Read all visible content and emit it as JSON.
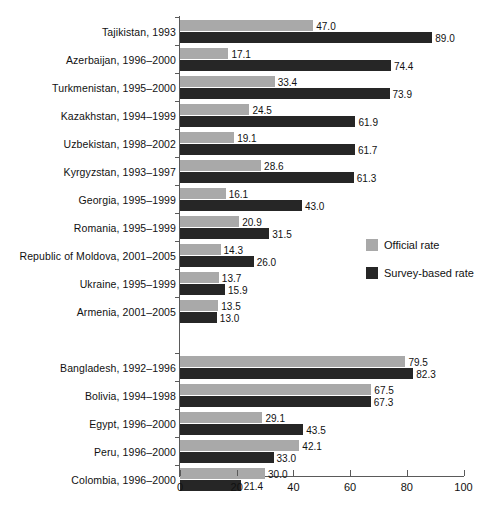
{
  "chart_data": {
    "type": "bar",
    "orientation": "horizontal",
    "title": "",
    "xlabel": "",
    "ylabel": "",
    "xlim": [
      0,
      100
    ],
    "xticks": [
      0,
      20,
      40,
      60,
      80,
      100
    ],
    "grid": false,
    "legend_position": "middle-right",
    "series": [
      {
        "name": "Official rate",
        "color": "#a9a9a9",
        "values": [
          47.0,
          17.1,
          33.4,
          24.5,
          19.1,
          28.6,
          16.1,
          20.9,
          14.3,
          13.7,
          13.5,
          79.5,
          67.5,
          29.1,
          42.1,
          30.0
        ]
      },
      {
        "name": "Survey-based rate",
        "color": "#262626",
        "values": [
          89.0,
          74.4,
          73.9,
          61.9,
          61.7,
          61.3,
          43.0,
          31.5,
          26.0,
          15.9,
          13.0,
          82.3,
          67.3,
          43.5,
          33.0,
          21.4
        ]
      }
    ],
    "categories": [
      "Tajikistan, 1993",
      "Azerbaijan, 1996–2000",
      "Turkmenistan, 1995–2000",
      "Kazakhstan, 1994–1999",
      "Uzbekistan, 1998–2002",
      "Kyrgyzstan, 1993–1997",
      "Georgia, 1995–1999",
      "Romania, 1995–1999",
      "Republic of Moldova, 2001–2005",
      "Ukraine, 1995–1999",
      "Armenia, 2001–2005",
      "Bangladesh, 1992–1996",
      "Bolivia, 1994–1998",
      "Egypt, 1996–2000",
      "Peru, 1996–2000",
      "Colombia, 1996–2000"
    ],
    "groups": [
      {
        "name": "group-1",
        "rows": [
          {
            "category": "Tajikistan, 1993",
            "official": "47.0",
            "survey": "89.0"
          },
          {
            "category": "Azerbaijan, 1996–2000",
            "official": "17.1",
            "survey": "74.4"
          },
          {
            "category": "Turkmenistan, 1995–2000",
            "official": "33.4",
            "survey": "73.9"
          },
          {
            "category": "Kazakhstan, 1994–1999",
            "official": "24.5",
            "survey": "61.9"
          },
          {
            "category": "Uzbekistan, 1998–2002",
            "official": "19.1",
            "survey": "61.7"
          },
          {
            "category": "Kyrgyzstan, 1993–1997",
            "official": "28.6",
            "survey": "61.3"
          },
          {
            "category": "Georgia, 1995–1999",
            "official": "16.1",
            "survey": "43.0"
          },
          {
            "category": "Romania, 1995–1999",
            "official": "20.9",
            "survey": "31.5"
          },
          {
            "category": "Republic of Moldova, 2001–2005",
            "official": "14.3",
            "survey": "26.0"
          },
          {
            "category": "Ukraine, 1995–1999",
            "official": "13.7",
            "survey": "15.9"
          },
          {
            "category": "Armenia, 2001–2005",
            "official": "13.5",
            "survey": "13.0"
          }
        ]
      },
      {
        "name": "group-2",
        "rows": [
          {
            "category": "Bangladesh, 1992–1996",
            "official": "79.5",
            "survey": "82.3"
          },
          {
            "category": "Bolivia, 1994–1998",
            "official": "67.5",
            "survey": "67.3"
          },
          {
            "category": "Egypt, 1996–2000",
            "official": "29.1",
            "survey": "43.5"
          },
          {
            "category": "Peru, 1996–2000",
            "official": "42.1",
            "survey": "33.0"
          },
          {
            "category": "Colombia, 1996–2000",
            "official": "30.0",
            "survey": "21.4"
          }
        ]
      }
    ]
  },
  "legend": {
    "items": [
      {
        "label": "Official rate",
        "key": "official"
      },
      {
        "label": "Survey-based rate",
        "key": "survey"
      }
    ]
  },
  "axis": {
    "x_tick_labels": [
      "0",
      "20",
      "40",
      "60",
      "80",
      "100"
    ]
  },
  "caption": {
    "text": ""
  }
}
